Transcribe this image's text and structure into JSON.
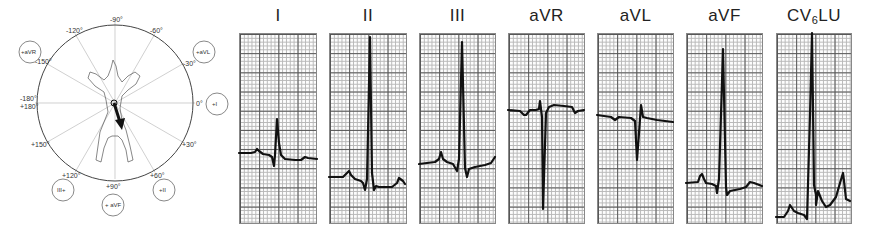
{
  "axis_diagram": {
    "angle_labels": {
      "top": "-90°",
      "upper_left_1": "-120°",
      "upper_right_1": "-60°",
      "upper_left_2": "-150°",
      "upper_right_2": "-30°",
      "left_a": "-180°",
      "left_b": "+180°",
      "right": "0°",
      "lower_left_2": "+150°",
      "lower_right_2": "+30°",
      "lower_left_1": "+120°",
      "lower_right_1": "+60°",
      "bottom": "+90°"
    },
    "lead_circles": {
      "avr": "+aVR",
      "avl": "+aVL",
      "lead_i": "+I",
      "lead_iii": "III+",
      "lead_ii": "+II",
      "avf": "+ aVF"
    },
    "arrow_direction_degrees": 75
  },
  "strips": [
    {
      "id": "I",
      "label": "I"
    },
    {
      "id": "II",
      "label": "II"
    },
    {
      "id": "III",
      "label": "III"
    },
    {
      "id": "aVR",
      "label": "aVR"
    },
    {
      "id": "aVL",
      "label": "aVL"
    },
    {
      "id": "aVF",
      "label": "aVF"
    },
    {
      "id": "CV6LU",
      "label_main": "CV",
      "label_sub": "6",
      "label_tail": "LU"
    }
  ]
}
